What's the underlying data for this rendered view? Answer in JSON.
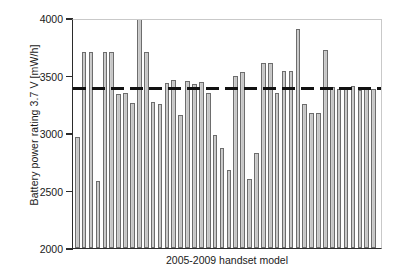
{
  "chart_data": {
    "type": "bar",
    "title": "",
    "subtitle": "",
    "xlabel": "2005-2009 handset model",
    "ylabel": "Battery power rating 3.7 V [mW/h]",
    "ylim": [
      2000,
      4000
    ],
    "ytick_values": [
      2000,
      2500,
      3000,
      3500,
      4000
    ],
    "ytick_labels": [
      "2000",
      "2500",
      "3000",
      "3500",
      "4000"
    ],
    "grid": false,
    "legend": null,
    "legend_position": "none",
    "bar_color": "#c8c8c8",
    "bar_edge_color": "#6d6d6d",
    "reference_line": {
      "label": "mean",
      "value": 3385,
      "style": "dashed",
      "color": "#111111"
    },
    "categories": [
      "1",
      "2",
      "3",
      "4",
      "5",
      "6",
      "7",
      "8",
      "9",
      "10",
      "11",
      "12",
      "13",
      "14",
      "15",
      "16",
      "17",
      "18",
      "19",
      "20",
      "21",
      "22",
      "23",
      "24",
      "25",
      "26",
      "27",
      "28",
      "29",
      "30",
      "31",
      "32",
      "33",
      "34",
      "35",
      "36",
      "37",
      "38",
      "39",
      "40",
      "41",
      "42",
      "43",
      "44"
    ],
    "values": [
      2965,
      3705,
      3705,
      2585,
      3705,
      3705,
      3335,
      3345,
      3265,
      4005,
      3705,
      3270,
      3250,
      3435,
      3460,
      3160,
      3455,
      3430,
      3440,
      3345,
      2980,
      2870,
      2680,
      3500,
      3530,
      2600,
      2830,
      3605,
      3605,
      3350,
      3535,
      3535,
      3905,
      3255,
      3175,
      3170,
      3720,
      3400,
      3380,
      3390,
      3410,
      3370,
      3395,
      3385
    ]
  },
  "axis": {
    "x_title": "2005-2009 handset model",
    "y_title": "Battery power rating 3.7 V [mW/h]",
    "y_ticks": [
      {
        "label": "4000",
        "value": 4000
      },
      {
        "label": "3500",
        "value": 3500
      },
      {
        "label": "3000",
        "value": 3000
      },
      {
        "label": "2500",
        "value": 2500
      },
      {
        "label": "2000",
        "value": 2000
      }
    ]
  }
}
